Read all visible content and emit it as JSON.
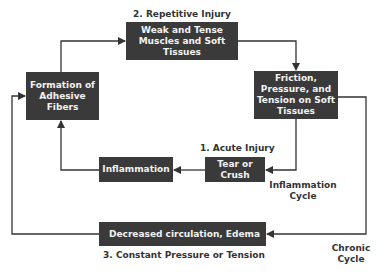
{
  "nodes": {
    "formation": "Formation of Adhesive Fibers",
    "weak": "Weak and Tense Muscles and Soft Tissues",
    "friction": "Friction, Pressure, and Tension on Soft Tissues",
    "tear": "Tear or Crush",
    "inflammation": "Inflammation",
    "decreased": "Decreased circulation, Edema"
  },
  "labels": {
    "repetitive": "2. Repetitive Injury",
    "acute": "1. Acute Injury",
    "constant": "3. Constant Pressure or Tension",
    "inflammation_cycle_1": "Inflammation",
    "inflammation_cycle_2": "Cycle",
    "chronic_cycle_1": "Chronic",
    "chronic_cycle_2": "Cycle"
  },
  "colors": {
    "box": "#3a3a3a",
    "line": "#333333"
  }
}
